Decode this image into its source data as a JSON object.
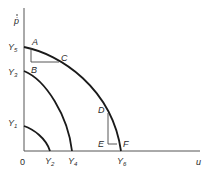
{
  "diagram": {
    "axes": {
      "y_label": "ṗ",
      "x_label": "u",
      "origin_label": "0"
    },
    "curves": [
      {
        "name": "inner",
        "y_intercept": {
          "base": "Y",
          "sub": "1"
        },
        "x_intercept": {
          "base": "Y",
          "sub": "2"
        }
      },
      {
        "name": "middle",
        "y_intercept": {
          "base": "Y",
          "sub": "3"
        },
        "x_intercept": {
          "base": "Y",
          "sub": "4"
        }
      },
      {
        "name": "outer",
        "y_intercept": {
          "base": "Y",
          "sub": "5"
        },
        "x_intercept": {
          "base": "Y",
          "sub": "6"
        }
      }
    ],
    "points": {
      "A": "A",
      "B": "B",
      "C": "C",
      "D": "D",
      "E": "E",
      "F": "F"
    }
  }
}
